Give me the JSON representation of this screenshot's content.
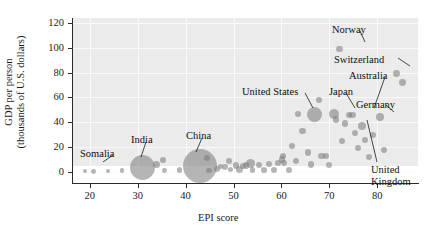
{
  "chart_data": {
    "type": "scatter",
    "title": "",
    "xlabel": "EPI score",
    "ylabel": "GDP per person (thousands of U.S. dollars)",
    "ylabel_line1": "GDP per person",
    "ylabel_line2": "(thousands of U.S. dollars)",
    "xlim": [
      16.5,
      88.5
    ],
    "ylim": [
      -9,
      124
    ],
    "xticks": [
      20,
      30,
      40,
      50,
      60,
      70,
      80
    ],
    "yticks": [
      0,
      20,
      40,
      60,
      80,
      100,
      120
    ],
    "xtick_labels": [
      "20",
      "30",
      "40",
      "50",
      "60",
      "70",
      "80"
    ],
    "ytick_labels": [
      "0",
      "20",
      "40",
      "60",
      "80",
      "100",
      "120"
    ],
    "grid": true,
    "legend": "none",
    "bubble_size_meaning": "population",
    "point_color": "#787878",
    "panel_color": "#ebebeb",
    "gridline_color": "#fafafa",
    "points": [
      {
        "x": 19.0,
        "y": 0.7,
        "r": 2.4,
        "label": "Somalia"
      },
      {
        "x": 20.7,
        "y": 0.5,
        "r": 2.4,
        "label": ""
      },
      {
        "x": 23.8,
        "y": 0.6,
        "r": 2.4,
        "label": ""
      },
      {
        "x": 26.7,
        "y": 0.9,
        "r": 2.3,
        "label": ""
      },
      {
        "x": 31.0,
        "y": 3.5,
        "r": 12.5,
        "label": "India"
      },
      {
        "x": 34.0,
        "y": 6.0,
        "r": 3.6,
        "label": ""
      },
      {
        "x": 35.3,
        "y": 9.5,
        "r": 2.8,
        "label": ""
      },
      {
        "x": 35.6,
        "y": 1.2,
        "r": 2.4,
        "label": ""
      },
      {
        "x": 38.7,
        "y": 1.5,
        "r": 2.6,
        "label": ""
      },
      {
        "x": 42.9,
        "y": 5.0,
        "r": 17.0,
        "label": "China"
      },
      {
        "x": 44.5,
        "y": 11.5,
        "r": 3.0,
        "label": ""
      },
      {
        "x": 44.9,
        "y": 1.0,
        "r": 2.9,
        "label": ""
      },
      {
        "x": 46.5,
        "y": 2.0,
        "r": 3.0,
        "label": ""
      },
      {
        "x": 47.3,
        "y": 4.5,
        "r": 2.6,
        "label": ""
      },
      {
        "x": 48.2,
        "y": 4.0,
        "r": 3.2,
        "label": ""
      },
      {
        "x": 49.1,
        "y": 8.5,
        "r": 3.0,
        "label": ""
      },
      {
        "x": 49.4,
        "y": 2.0,
        "r": 2.8,
        "label": ""
      },
      {
        "x": 50.5,
        "y": 4.8,
        "r": 3.4,
        "label": ""
      },
      {
        "x": 51.3,
        "y": 2.0,
        "r": 3.4,
        "label": ""
      },
      {
        "x": 51.9,
        "y": 4.5,
        "r": 3.0,
        "label": ""
      },
      {
        "x": 52.6,
        "y": 5.0,
        "r": 3.2,
        "label": ""
      },
      {
        "x": 53.5,
        "y": 7.0,
        "r": 4.6,
        "label": ""
      },
      {
        "x": 54.0,
        "y": 1.5,
        "r": 2.8,
        "label": ""
      },
      {
        "x": 55.3,
        "y": 5.5,
        "r": 3.2,
        "label": ""
      },
      {
        "x": 56.4,
        "y": 1.7,
        "r": 2.8,
        "label": ""
      },
      {
        "x": 57.4,
        "y": 6.0,
        "r": 3.0,
        "label": ""
      },
      {
        "x": 58.4,
        "y": 1.8,
        "r": 3.0,
        "label": ""
      },
      {
        "x": 59.2,
        "y": 7.0,
        "r": 3.0,
        "label": ""
      },
      {
        "x": 60.1,
        "y": 10.0,
        "r": 3.2,
        "label": ""
      },
      {
        "x": 60.3,
        "y": 13.0,
        "r": 3.0,
        "label": ""
      },
      {
        "x": 60.6,
        "y": 7.5,
        "r": 3.0,
        "label": ""
      },
      {
        "x": 61.6,
        "y": 1.5,
        "r": 3.0,
        "label": ""
      },
      {
        "x": 62.3,
        "y": 21.0,
        "r": 3.0,
        "label": ""
      },
      {
        "x": 63.0,
        "y": 8.5,
        "r": 3.0,
        "label": ""
      },
      {
        "x": 63.5,
        "y": 46.5,
        "r": 3.2,
        "label": ""
      },
      {
        "x": 64.4,
        "y": 33.0,
        "r": 3.2,
        "label": ""
      },
      {
        "x": 65.6,
        "y": 15.5,
        "r": 3.2,
        "label": ""
      },
      {
        "x": 66.2,
        "y": 6.0,
        "r": 3.2,
        "label": ""
      },
      {
        "x": 67.0,
        "y": 46.0,
        "r": 7.5,
        "label": "United States"
      },
      {
        "x": 67.8,
        "y": 58.0,
        "r": 3.0,
        "label": ""
      },
      {
        "x": 68.4,
        "y": 13.0,
        "r": 3.2,
        "label": ""
      },
      {
        "x": 69.2,
        "y": 12.5,
        "r": 3.0,
        "label": ""
      },
      {
        "x": 69.9,
        "y": 5.5,
        "r": 3.0,
        "label": ""
      },
      {
        "x": 71.0,
        "y": 46.5,
        "r": 5.0,
        "label": "Japan"
      },
      {
        "x": 71.4,
        "y": 42.0,
        "r": 3.4,
        "label": ""
      },
      {
        "x": 72.1,
        "y": 99.0,
        "r": 3.2,
        "label": "Norway"
      },
      {
        "x": 72.6,
        "y": 24.5,
        "r": 3.0,
        "label": ""
      },
      {
        "x": 73.3,
        "y": 39.0,
        "r": 3.2,
        "label": ""
      },
      {
        "x": 74.2,
        "y": 45.5,
        "r": 3.0,
        "label": ""
      },
      {
        "x": 74.8,
        "y": 46.0,
        "r": 3.2,
        "label": "Australia"
      },
      {
        "x": 75.4,
        "y": 31.0,
        "r": 3.0,
        "label": ""
      },
      {
        "x": 76.0,
        "y": 19.0,
        "r": 3.2,
        "label": ""
      },
      {
        "x": 76.9,
        "y": 37.0,
        "r": 4.0,
        "label": "United Kingdom"
      },
      {
        "x": 77.5,
        "y": 25.5,
        "r": 3.0,
        "label": ""
      },
      {
        "x": 78.3,
        "y": 12.0,
        "r": 3.0,
        "label": ""
      },
      {
        "x": 79.1,
        "y": 30.0,
        "r": 3.0,
        "label": ""
      },
      {
        "x": 80.6,
        "y": 44.5,
        "r": 4.0,
        "label": "Germany"
      },
      {
        "x": 81.5,
        "y": 18.0,
        "r": 3.0,
        "label": ""
      },
      {
        "x": 84.0,
        "y": 79.5,
        "r": 3.4,
        "label": "Switzerland"
      },
      {
        "x": 85.2,
        "y": 72.0,
        "r": 3.4,
        "label": ""
      }
    ],
    "annotations": [
      {
        "name": "somalia",
        "text": "Somalia",
        "x": 80,
        "y": 148,
        "leader": [
          113,
          155,
          103,
          162
        ]
      },
      {
        "name": "india",
        "text": "India",
        "x": 131,
        "y": 134,
        "leader": [
          146,
          142,
          141,
          157
        ]
      },
      {
        "name": "china",
        "text": "China",
        "x": 186,
        "y": 130,
        "leader": [
          202,
          138,
          196,
          152
        ]
      },
      {
        "name": "united-states",
        "text": "United States",
        "x": 242,
        "y": 86,
        "leader": [
          305,
          93,
          313,
          108
        ]
      },
      {
        "name": "japan",
        "text": "Japan",
        "x": 329,
        "y": 86,
        "leader": [
          346,
          93,
          355,
          108
        ]
      },
      {
        "name": "australia",
        "text": "Australia",
        "x": 349,
        "y": 70,
        "leader": [
          385,
          77,
          374,
          108
        ]
      },
      {
        "name": "norway",
        "text": "Norway",
        "x": 332,
        "y": 24,
        "leader": [
          360,
          31,
          365,
          42
        ]
      },
      {
        "name": "switzerland",
        "text": "Switzerland",
        "x": 334,
        "y": 54,
        "leader": [
          398,
          58,
          410,
          66
        ]
      },
      {
        "name": "germany",
        "text": "Germany",
        "x": 356,
        "y": 99,
        "leader": [
          386,
          105,
          394,
          112
        ]
      },
      {
        "name": "united-kingdom-line1",
        "text": "United",
        "x": 371,
        "y": 164,
        "leader": null
      },
      {
        "name": "united-kingdom-line2",
        "text": "Kingdom",
        "x": 371,
        "y": 176,
        "leader": [
          377,
          162,
          367,
          120
        ]
      }
    ]
  }
}
